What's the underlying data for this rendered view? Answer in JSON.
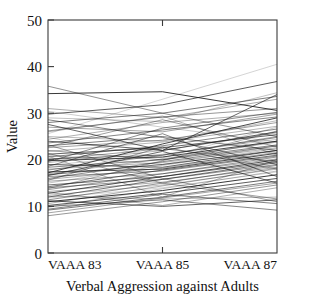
{
  "chart_data": {
    "type": "line",
    "title": "",
    "xlabel": "Verbal Aggression against Adults",
    "ylabel": "Value",
    "categories": [
      "VAAA 83",
      "VAAA 85",
      "VAAA 87"
    ],
    "ylim": [
      0,
      50
    ],
    "yticks": [
      0,
      10,
      20,
      30,
      40,
      50
    ],
    "ytick_labels": [
      "0",
      "10",
      "20",
      "30",
      "40",
      "50"
    ],
    "grid": false,
    "legend": "none",
    "line_color": "#1a1a1a",
    "background_color": "#ffffff",
    "axis_color": "#3b3b3b",
    "note": "Spaghetti / parallel-coordinates plot: one polyline per subject across three measurement occasions.",
    "series": [
      {
        "name": "s1",
        "values": [
          25.6,
          33.0,
          40.5
        ]
      },
      {
        "name": "s2",
        "values": [
          35.8,
          30.0,
          25.0
        ]
      },
      {
        "name": "s3",
        "values": [
          34.2,
          34.6,
          30.6
        ]
      },
      {
        "name": "s4",
        "values": [
          31.0,
          29.0,
          33.0
        ]
      },
      {
        "name": "s5",
        "values": [
          29.8,
          31.8,
          36.8
        ]
      },
      {
        "name": "s6",
        "values": [
          29.0,
          28.2,
          34.4
        ]
      },
      {
        "name": "s7",
        "values": [
          28.0,
          30.0,
          33.6
        ]
      },
      {
        "name": "s8",
        "values": [
          27.0,
          26.0,
          29.8
        ]
      },
      {
        "name": "s9",
        "values": [
          26.2,
          29.2,
          31.0
        ]
      },
      {
        "name": "s10",
        "values": [
          25.0,
          24.0,
          28.4
        ]
      },
      {
        "name": "s11",
        "values": [
          24.4,
          28.0,
          30.0
        ]
      },
      {
        "name": "s12",
        "values": [
          24.0,
          22.0,
          26.0
        ]
      },
      {
        "name": "s13",
        "values": [
          23.6,
          26.4,
          29.2
        ]
      },
      {
        "name": "s14",
        "values": [
          23.0,
          25.0,
          22.0
        ]
      },
      {
        "name": "s15",
        "values": [
          22.6,
          24.2,
          28.0
        ]
      },
      {
        "name": "s16",
        "values": [
          22.0,
          20.0,
          24.0
        ]
      },
      {
        "name": "s17",
        "values": [
          21.8,
          23.8,
          27.2
        ]
      },
      {
        "name": "s18",
        "values": [
          21.2,
          22.6,
          25.4
        ]
      },
      {
        "name": "s19",
        "values": [
          21.0,
          19.0,
          23.0
        ]
      },
      {
        "name": "s20",
        "values": [
          20.6,
          23.0,
          26.6
        ]
      },
      {
        "name": "s21",
        "values": [
          20.2,
          21.0,
          24.8
        ]
      },
      {
        "name": "s22",
        "values": [
          20.0,
          22.4,
          19.6
        ]
      },
      {
        "name": "s23",
        "values": [
          19.8,
          20.6,
          24.0
        ]
      },
      {
        "name": "s24",
        "values": [
          19.4,
          22.0,
          25.8
        ]
      },
      {
        "name": "s25",
        "values": [
          19.0,
          18.4,
          22.0
        ]
      },
      {
        "name": "s26",
        "values": [
          18.8,
          21.2,
          24.4
        ]
      },
      {
        "name": "s27",
        "values": [
          18.4,
          20.0,
          23.2
        ]
      },
      {
        "name": "s28",
        "values": [
          18.0,
          19.4,
          22.6
        ]
      },
      {
        "name": "s29",
        "values": [
          17.8,
          21.0,
          25.0
        ]
      },
      {
        "name": "s30",
        "values": [
          17.4,
          18.0,
          21.4
        ]
      },
      {
        "name": "s31",
        "values": [
          17.0,
          20.2,
          23.8
        ]
      },
      {
        "name": "s32",
        "values": [
          16.8,
          19.0,
          22.0
        ]
      },
      {
        "name": "s33",
        "values": [
          16.4,
          17.6,
          20.8
        ]
      },
      {
        "name": "s34",
        "values": [
          16.0,
          19.6,
          23.0
        ]
      },
      {
        "name": "s35",
        "values": [
          15.8,
          18.2,
          21.6
        ]
      },
      {
        "name": "s36",
        "values": [
          15.4,
          17.0,
          20.2
        ]
      },
      {
        "name": "s37",
        "values": [
          15.0,
          18.8,
          22.4
        ]
      },
      {
        "name": "s38",
        "values": [
          14.6,
          16.4,
          19.6
        ]
      },
      {
        "name": "s39",
        "values": [
          14.2,
          17.8,
          21.0
        ]
      },
      {
        "name": "s40",
        "values": [
          14.0,
          15.8,
          19.0
        ]
      },
      {
        "name": "s41",
        "values": [
          13.6,
          17.0,
          20.6
        ]
      },
      {
        "name": "s42",
        "values": [
          13.2,
          15.2,
          18.4
        ]
      },
      {
        "name": "s43",
        "values": [
          12.8,
          16.4,
          20.0
        ]
      },
      {
        "name": "s44",
        "values": [
          12.4,
          14.6,
          18.0
        ]
      },
      {
        "name": "s45",
        "values": [
          12.0,
          15.8,
          19.4
        ]
      },
      {
        "name": "s46",
        "values": [
          11.8,
          14.0,
          17.4
        ]
      },
      {
        "name": "s47",
        "values": [
          11.4,
          15.0,
          18.8
        ]
      },
      {
        "name": "s48",
        "values": [
          11.0,
          13.4,
          16.8
        ]
      },
      {
        "name": "s49",
        "values": [
          10.6,
          14.4,
          18.2
        ]
      },
      {
        "name": "s50",
        "values": [
          10.2,
          12.8,
          16.0
        ]
      },
      {
        "name": "s51",
        "values": [
          9.8,
          13.8,
          17.6
        ]
      },
      {
        "name": "s52",
        "values": [
          9.2,
          12.0,
          15.4
        ]
      },
      {
        "name": "s53",
        "values": [
          8.6,
          11.8,
          15.0
        ]
      },
      {
        "name": "s54",
        "values": [
          8.0,
          11.0,
          14.6
        ]
      },
      {
        "name": "s55",
        "values": [
          12.2,
          11.6,
          12.0
        ]
      },
      {
        "name": "s56",
        "values": [
          13.0,
          10.2,
          14.0
        ]
      },
      {
        "name": "s57",
        "values": [
          11.2,
          10.0,
          11.4
        ]
      },
      {
        "name": "s58",
        "values": [
          10.0,
          11.4,
          9.2
        ]
      },
      {
        "name": "s59",
        "values": [
          9.4,
          12.6,
          10.6
        ]
      },
      {
        "name": "s60",
        "values": [
          21.4,
          15.0,
          11.6
        ]
      },
      {
        "name": "s61",
        "values": [
          23.2,
          16.0,
          11.0
        ]
      },
      {
        "name": "s62",
        "values": [
          26.0,
          29.4,
          21.0
        ]
      },
      {
        "name": "s63",
        "values": [
          27.6,
          22.0,
          34.0
        ]
      },
      {
        "name": "s64",
        "values": [
          30.4,
          27.0,
          23.8
        ]
      },
      {
        "name": "s65",
        "values": [
          28.6,
          24.8,
          19.0
        ]
      },
      {
        "name": "s66",
        "values": [
          19.6,
          26.8,
          30.2
        ]
      },
      {
        "name": "s67",
        "values": [
          22.8,
          28.6,
          22.8
        ]
      },
      {
        "name": "s68",
        "values": [
          17.2,
          23.4,
          29.0
        ]
      },
      {
        "name": "s69",
        "values": [
          20.8,
          12.0,
          20.0
        ]
      },
      {
        "name": "s70",
        "values": [
          16.6,
          21.8,
          15.0
        ]
      },
      {
        "name": "s71",
        "values": [
          24.8,
          20.4,
          27.0
        ]
      },
      {
        "name": "s72",
        "values": [
          18.6,
          25.6,
          16.4
        ]
      },
      {
        "name": "s73",
        "values": [
          13.8,
          19.8,
          26.2
        ]
      },
      {
        "name": "s74",
        "values": [
          15.6,
          22.8,
          18.0
        ]
      }
    ]
  },
  "axes": {
    "y_title": "Value",
    "x_title": "Verbal Aggression against Adults"
  }
}
